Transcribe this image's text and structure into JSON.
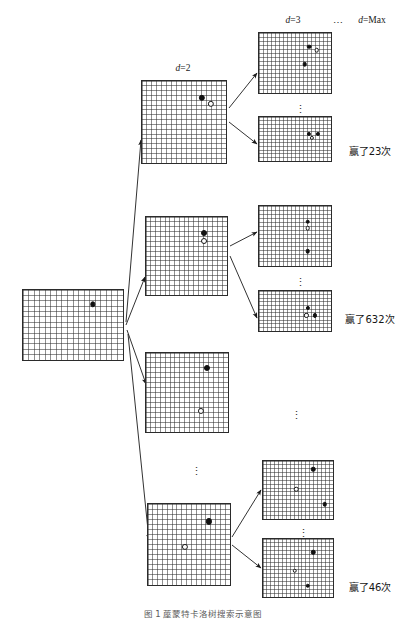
{
  "figure": {
    "title": "蓙蒙特卡洛树搜索示意图",
    "caption": "图 1  蓙蒙特卡洛树搜索示意图"
  },
  "depth_labels": [
    {
      "id": "d2",
      "text": "d=2",
      "x": 183,
      "y": 64
    },
    {
      "id": "d3",
      "text": "d=3",
      "x": 293,
      "y": 16
    },
    {
      "id": "dmax",
      "text": "d=Max",
      "x": 372,
      "y": 16
    }
  ],
  "level_ellipsis": {
    "between_d3_and_dmax": "⋯"
  },
  "win_labels": [
    {
      "id": "win-top",
      "text": "赢了23次",
      "count": 23,
      "x": 370,
      "y": 152
    },
    {
      "id": "win-middle",
      "text": "赢了632次",
      "count": 632,
      "x": 370,
      "y": 320
    },
    {
      "id": "win-bottom",
      "text": "赢了46次",
      "count": 46,
      "x": 370,
      "y": 588
    }
  ],
  "boards": [
    {
      "id": "root",
      "role": "root-board",
      "x": 22,
      "y": 289,
      "w": 102,
      "h": 72,
      "cols": 18,
      "rows": 13,
      "stones": [
        {
          "color": "black",
          "cx": 0.685,
          "cy": 0.2
        }
      ]
    },
    {
      "id": "d2-a",
      "role": "depth2-board",
      "x": 141,
      "y": 80,
      "w": 86,
      "h": 84,
      "cols": 17,
      "rows": 17,
      "stones": [
        {
          "color": "black",
          "cx": 0.7,
          "cy": 0.2
        },
        {
          "color": "white",
          "cx": 0.8,
          "cy": 0.27
        }
      ]
    },
    {
      "id": "d2-b",
      "role": "depth2-board",
      "x": 145,
      "y": 216,
      "w": 83,
      "h": 80,
      "cols": 17,
      "rows": 16,
      "stones": [
        {
          "color": "black",
          "cx": 0.7,
          "cy": 0.2
        },
        {
          "color": "white",
          "cx": 0.7,
          "cy": 0.3
        }
      ]
    },
    {
      "id": "d2-c",
      "role": "depth2-board",
      "x": 145,
      "y": 352,
      "w": 84,
      "h": 81,
      "cols": 17,
      "rows": 16,
      "stones": [
        {
          "color": "black",
          "cx": 0.72,
          "cy": 0.19
        },
        {
          "color": "white",
          "cx": 0.66,
          "cy": 0.71
        }
      ]
    },
    {
      "id": "d2-d",
      "role": "depth2-board",
      "x": 147,
      "y": 503,
      "w": 84,
      "h": 83,
      "cols": 17,
      "rows": 16,
      "stones": [
        {
          "color": "black",
          "cx": 0.73,
          "cy": 0.21
        },
        {
          "color": "white",
          "cx": 0.44,
          "cy": 0.52
        }
      ]
    },
    {
      "id": "d3-a",
      "role": "depth3-board",
      "x": 258,
      "y": 32,
      "w": 74,
      "h": 62,
      "cols": 18,
      "rows": 15,
      "stones": [
        {
          "color": "black",
          "cx": 0.68,
          "cy": 0.22
        },
        {
          "color": "white",
          "cx": 0.78,
          "cy": 0.28
        },
        {
          "color": "black",
          "cx": 0.62,
          "cy": 0.5
        }
      ]
    },
    {
      "id": "dmax-a",
      "role": "depthmax-board",
      "x": 258,
      "y": 116,
      "w": 74,
      "h": 46,
      "cols": 18,
      "rows": 12,
      "stones": [
        {
          "color": "black",
          "cx": 0.68,
          "cy": 0.36
        },
        {
          "color": "black",
          "cx": 0.8,
          "cy": 0.36
        },
        {
          "color": "white",
          "cx": 0.72,
          "cy": 0.46
        }
      ]
    },
    {
      "id": "d3-b",
      "role": "depth3-board",
      "x": 258,
      "y": 205,
      "w": 74,
      "h": 62,
      "cols": 18,
      "rows": 15,
      "stones": [
        {
          "color": "black",
          "cx": 0.66,
          "cy": 0.25
        },
        {
          "color": "white",
          "cx": 0.66,
          "cy": 0.36
        },
        {
          "color": "black",
          "cx": 0.66,
          "cy": 0.73
        }
      ]
    },
    {
      "id": "dmax-b",
      "role": "depthmax-board",
      "x": 258,
      "y": 290,
      "w": 74,
      "h": 42,
      "cols": 18,
      "rows": 11,
      "stones": [
        {
          "color": "black",
          "cx": 0.66,
          "cy": 0.4
        },
        {
          "color": "white",
          "cx": 0.64,
          "cy": 0.58
        },
        {
          "color": "black",
          "cx": 0.76,
          "cy": 0.58
        }
      ]
    },
    {
      "id": "d3-c",
      "role": "depth3-board",
      "x": 262,
      "y": 460,
      "w": 72,
      "h": 60,
      "cols": 18,
      "rows": 15,
      "stones": [
        {
          "color": "black",
          "cx": 0.7,
          "cy": 0.14
        },
        {
          "color": "white",
          "cx": 0.46,
          "cy": 0.47
        },
        {
          "color": "black",
          "cx": 0.86,
          "cy": 0.72
        }
      ]
    },
    {
      "id": "dmax-c",
      "role": "depthmax-board",
      "x": 262,
      "y": 538,
      "w": 72,
      "h": 60,
      "cols": 18,
      "rows": 15,
      "stones": [
        {
          "color": "black",
          "cx": 0.7,
          "cy": 0.22
        },
        {
          "color": "white",
          "cx": 0.44,
          "cy": 0.53
        },
        {
          "color": "black",
          "cx": 0.62,
          "cy": 0.78
        }
      ]
    }
  ],
  "ellipses": [
    {
      "id": "vdots-d3-a",
      "x": 295,
      "y": 104,
      "glyph": "⋮"
    },
    {
      "id": "vdots-d3-b",
      "x": 295,
      "y": 277,
      "glyph": "⋮"
    },
    {
      "id": "vdots-d3-c",
      "x": 298,
      "y": 528,
      "glyph": "⋮"
    },
    {
      "id": "vdots-mid",
      "x": 291,
      "y": 410,
      "glyph": "⋮"
    },
    {
      "id": "vdots-d2",
      "x": 191,
      "y": 466,
      "glyph": "⋮"
    }
  ],
  "edges": [
    {
      "id": "root-to-d2a",
      "from": "root",
      "to": "d2-a",
      "x1": 126,
      "y1": 322,
      "x2": 141,
      "y2": 140
    },
    {
      "id": "root-to-d2b",
      "from": "root",
      "to": "d2-b",
      "x1": 126,
      "y1": 325,
      "x2": 145,
      "y2": 277
    },
    {
      "id": "root-to-d2c",
      "from": "root",
      "to": "d2-c",
      "x1": 127,
      "y1": 330,
      "x2": 146,
      "y2": 384
    },
    {
      "id": "root-to-d2d",
      "from": "root",
      "to": "d2-d",
      "x1": 128,
      "y1": 334,
      "x2": 149,
      "y2": 540
    },
    {
      "id": "d2a-to-d3a",
      "from": "d2-a",
      "to": "d3-a",
      "x1": 229,
      "y1": 108,
      "x2": 257,
      "y2": 73
    },
    {
      "id": "d2a-to-dmaxa",
      "from": "d2-a",
      "to": "dmax-a",
      "x1": 229,
      "y1": 122,
      "x2": 257,
      "y2": 144
    },
    {
      "id": "d2b-to-d3b",
      "from": "d2-b",
      "to": "d3-b",
      "x1": 230,
      "y1": 246,
      "x2": 257,
      "y2": 232
    },
    {
      "id": "d2b-to-dmaxb",
      "from": "d2-b",
      "to": "dmax-b",
      "x1": 230,
      "y1": 256,
      "x2": 257,
      "y2": 318
    },
    {
      "id": "d2d-to-d3c",
      "from": "d2-d",
      "to": "d3-c",
      "x1": 232,
      "y1": 537,
      "x2": 261,
      "y2": 490
    },
    {
      "id": "d2d-to-dmaxc",
      "from": "d2-d",
      "to": "dmax-c",
      "x1": 232,
      "y1": 545,
      "x2": 261,
      "y2": 568
    }
  ]
}
